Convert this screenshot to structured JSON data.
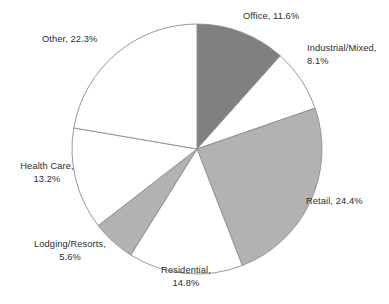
{
  "chart_data": {
    "type": "pie",
    "title": "",
    "legend_position": "none",
    "labels_mode": "outside-callout",
    "categories": [
      "Office",
      "Industrial/Mixed",
      "Retail",
      "Residential",
      "Lodging/Resorts",
      "Health Care",
      "Other"
    ],
    "values": [
      11.6,
      8.1,
      24.4,
      14.8,
      5.6,
      13.2,
      22.3
    ],
    "unit": "%",
    "start_angle_deg": 0,
    "direction": "clockwise",
    "total": 100.0,
    "slices": [
      {
        "name": "Office",
        "label": "Office, 11.6%",
        "value": 11.6,
        "color": "#808080",
        "stroke": "#8c8c8c"
      },
      {
        "name": "Industrial/Mixed",
        "label": "Industrial/Mixed,",
        "label_line2": "8.1%",
        "value": 8.1,
        "color": "#ffffff",
        "stroke": "#8c8c8c"
      },
      {
        "name": "Retail",
        "label": "Retail, 24.4%",
        "value": 24.4,
        "color": "#b2b2b2",
        "stroke": "#8c8c8c"
      },
      {
        "name": "Residential",
        "label": "Residential,",
        "label_line2": "14.8%",
        "value": 14.8,
        "color": "#ffffff",
        "stroke": "#8c8c8c"
      },
      {
        "name": "Lodging/Resorts",
        "label": "Lodging/Resorts,",
        "label_line2": "5.6%",
        "value": 5.6,
        "color": "#b2b2b2",
        "stroke": "#8c8c8c"
      },
      {
        "name": "Health Care",
        "label": "Health Care,",
        "label_line2": "13.2%",
        "value": 13.2,
        "color": "#ffffff",
        "stroke": "#8c8c8c"
      },
      {
        "name": "Other",
        "label": "Other, 22.3%",
        "value": 22.3,
        "color": "#ffffff",
        "stroke": "#8c8c8c"
      }
    ],
    "xlabel": "",
    "ylabel": ""
  },
  "geometry": {
    "center_x": 197,
    "center_y": 149,
    "radius": 125
  },
  "colors": {
    "background": "#ffffff",
    "text": "#2b2b2b",
    "outline": "#8c8c8c",
    "dark_gray": "#808080",
    "light_gray": "#b2b2b2",
    "white": "#ffffff"
  }
}
